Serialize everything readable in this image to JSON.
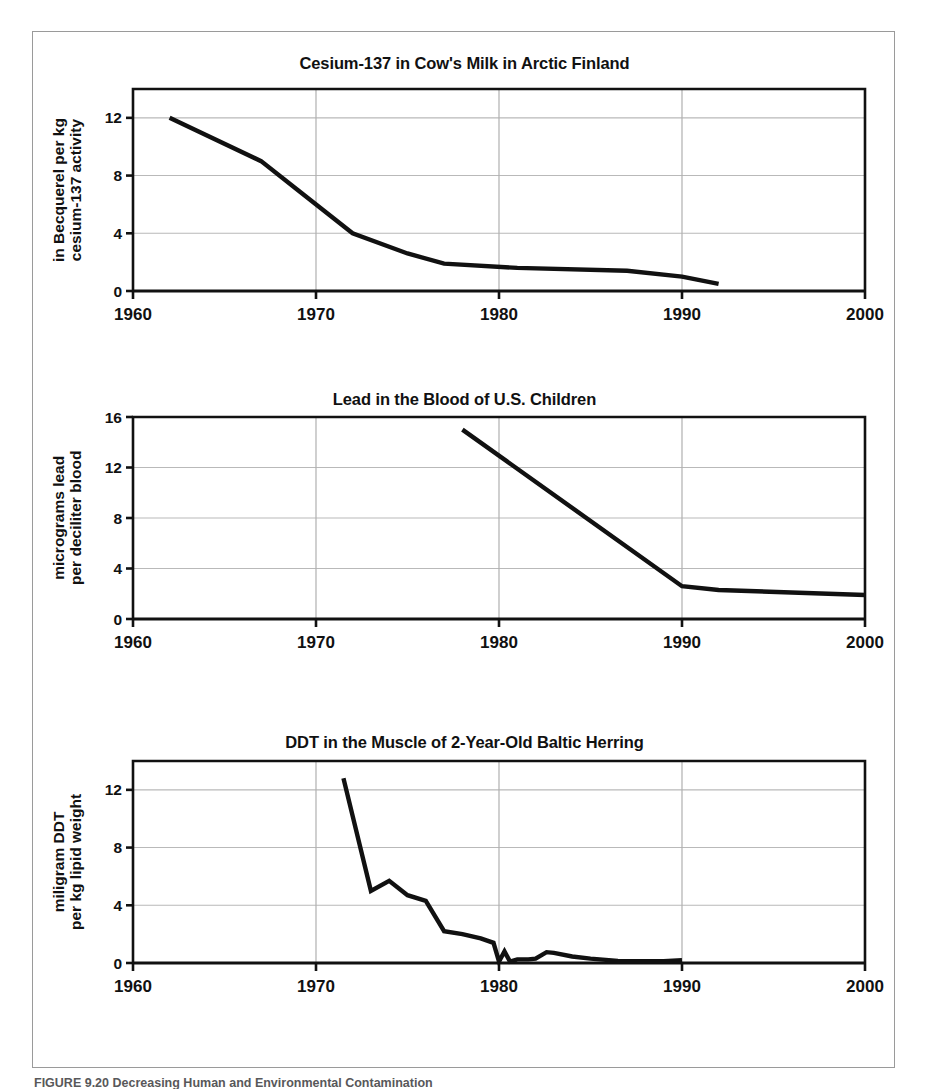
{
  "figure": {
    "caption": "FIGURE 9.20 Decreasing Human and Environmental Contamination",
    "background_color": "#ffffff",
    "frame_color": "#9a9a9a",
    "line_color": "#111111",
    "grid_color": "#b9b9b9"
  },
  "chart_data": [
    {
      "type": "line",
      "title": "Cesium-137 in Cow's Milk in Arctic Finland",
      "xlabel": "",
      "ylabel": "in Becquerel per kg cesium-137 activity",
      "ylabel_lines": [
        "in Becquerel per kg",
        "cesium-137 activity"
      ],
      "xlim": [
        1960,
        2000
      ],
      "ylim": [
        0,
        14
      ],
      "xticks": [
        1960,
        1970,
        1980,
        1990,
        2000
      ],
      "xticklabels": [
        "1960",
        "1970",
        "1980",
        "1990",
        "2000"
      ],
      "yticks": [
        0,
        4,
        8,
        12
      ],
      "yticklabels": [
        "0",
        "4",
        "8",
        "12"
      ],
      "grid": "both",
      "legend": "none",
      "series": [
        {
          "name": "cesium-137 activity",
          "x": [
            1962,
            1967,
            1969,
            1972,
            1975,
            1977,
            1981,
            1987,
            1990,
            1992
          ],
          "values": [
            12.0,
            9.0,
            7.0,
            4.0,
            2.6,
            1.9,
            1.6,
            1.4,
            1.0,
            0.5
          ]
        }
      ]
    },
    {
      "type": "line",
      "title": "Lead in the Blood of U.S. Children",
      "xlabel": "",
      "ylabel": "micrograms lead per deciliter blood",
      "ylabel_lines": [
        "micrograms lead",
        "per deciliter blood"
      ],
      "xlim": [
        1960,
        2000
      ],
      "ylim": [
        0,
        16
      ],
      "xticks": [
        1960,
        1970,
        1980,
        1990,
        2000
      ],
      "xticklabels": [
        "1960",
        "1970",
        "1980",
        "1990",
        "2000"
      ],
      "yticks": [
        0,
        4,
        8,
        12,
        16
      ],
      "yticklabels": [
        "0",
        "4",
        "8",
        "12",
        "16"
      ],
      "grid": "both",
      "legend": "none",
      "series": [
        {
          "name": "blood lead level",
          "x": [
            1978,
            1990,
            1992,
            2000
          ],
          "values": [
            15.0,
            2.6,
            2.3,
            1.9
          ]
        }
      ]
    },
    {
      "type": "line",
      "title": "DDT in the Muscle of 2-Year-Old Baltic Herring",
      "xlabel": "",
      "ylabel": "miligram DDT per kg lipid weight",
      "ylabel_lines": [
        "miligram DDT",
        "per kg lipid weight"
      ],
      "xlim": [
        1960,
        2000
      ],
      "ylim": [
        0,
        14
      ],
      "xticks": [
        1960,
        1970,
        1980,
        1990,
        2000
      ],
      "xticklabels": [
        "1960",
        "1970",
        "1980",
        "1990",
        "2000"
      ],
      "yticks": [
        0,
        4,
        8,
        12
      ],
      "yticklabels": [
        "0",
        "4",
        "8",
        "12"
      ],
      "grid": "both",
      "legend": "none",
      "series": [
        {
          "name": "DDT in herring muscle",
          "x": [
            1971.5,
            1973.0,
            1974.0,
            1975.0,
            1976.0,
            1977.0,
            1978.0,
            1979.0,
            1979.7,
            1980.0,
            1980.3,
            1980.6,
            1981.0,
            1981.6,
            1982.0,
            1982.6,
            1983.0,
            1984.0,
            1985.0,
            1986.5,
            1988.0,
            1989.0,
            1990.0
          ],
          "values": [
            12.8,
            5.0,
            5.7,
            4.7,
            4.3,
            2.2,
            2.0,
            1.7,
            1.4,
            0.1,
            0.8,
            0.1,
            0.25,
            0.25,
            0.3,
            0.75,
            0.7,
            0.45,
            0.3,
            0.15,
            0.12,
            0.12,
            0.2
          ]
        }
      ]
    }
  ]
}
